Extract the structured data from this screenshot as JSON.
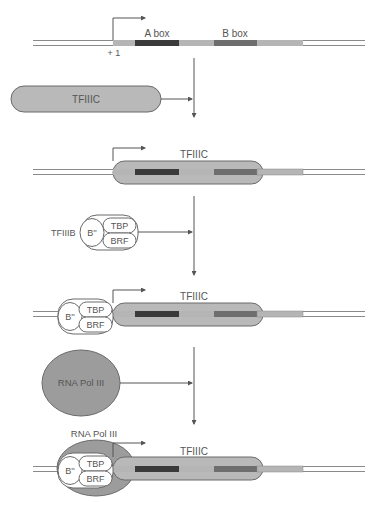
{
  "diagram": {
    "colors": {
      "dna_strand": "#8a8a8a",
      "gene_light": "#b5b5b5",
      "a_box": "#3a3a3a",
      "b_box": "#6e6e6e",
      "tfiiic_fill": "#b9b9b9",
      "rna_pol_fill": "#9c9c9c",
      "outline": "#6a6a6a",
      "arrow": "#555555",
      "text": "#555555"
    },
    "step1": {
      "a_box_label": "A box",
      "b_box_label": "B box",
      "start_site_label": "+ 1"
    },
    "step2": {
      "factor_label": "TFIIIC"
    },
    "step3": {
      "bound_label": "TFIIIC"
    },
    "step4": {
      "complex_label": "TFIIIB",
      "subunits": [
        "B''",
        "TBP",
        "BRF"
      ]
    },
    "step5": {
      "tfiiic_label": "TFIIIC",
      "subunits": [
        "B''",
        "TBP",
        "BRF"
      ]
    },
    "step6": {
      "factor_label": "RNA Pol III"
    },
    "step7": {
      "pol_label": "RNA Pol III",
      "tfiiic_label": "TFIIIC",
      "subunits": [
        "B''",
        "TBP",
        "BRF"
      ]
    }
  }
}
